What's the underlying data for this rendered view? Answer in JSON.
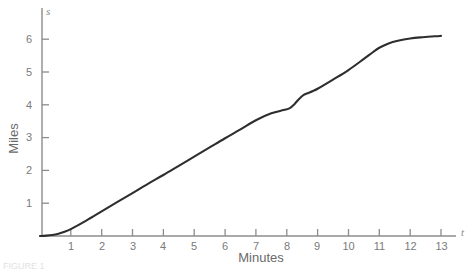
{
  "chart_data": {
    "type": "line",
    "title": "",
    "subtitle": "",
    "xlabel": "Minutes",
    "ylabel": "Miles",
    "x_axis_symbol": "t",
    "y_axis_symbol": "s",
    "xlim": [
      0,
      13.6
    ],
    "ylim": [
      0,
      6.45
    ],
    "xticks": [
      1,
      2,
      3,
      4,
      5,
      6,
      7,
      8,
      9,
      10,
      11,
      12,
      13
    ],
    "yticks": [
      1,
      2,
      3,
      4,
      5,
      6
    ],
    "xtick_labels": [
      "1",
      "2",
      "3",
      "4",
      "5",
      "6",
      "7",
      "8",
      "9",
      "10",
      "11",
      "12",
      "13"
    ],
    "ytick_labels": [
      "1",
      "2",
      "3",
      "4",
      "5",
      "6"
    ],
    "grid": false,
    "legend": false,
    "legend_position": "none",
    "line_color": "#2e2e2e",
    "axis_color": "#8c8c8c",
    "background_color": "#ffffff",
    "annotations": [],
    "series": [
      {
        "name": "distance",
        "x": [
          0.0,
          0.2,
          0.4,
          0.6,
          0.8,
          1.0,
          1.5,
          2.0,
          2.5,
          3.0,
          3.5,
          4.0,
          4.5,
          5.0,
          5.5,
          6.0,
          6.5,
          7.0,
          7.5,
          7.9,
          8.1,
          8.25,
          8.4,
          8.55,
          8.7,
          8.85,
          9.0,
          9.5,
          10.0,
          10.5,
          10.8,
          11.0,
          11.3,
          11.6,
          12.0,
          12.4,
          12.8,
          13.0
        ],
        "y": [
          0.0,
          0.01,
          0.03,
          0.07,
          0.13,
          0.21,
          0.47,
          0.75,
          1.03,
          1.31,
          1.59,
          1.86,
          2.14,
          2.42,
          2.7,
          2.98,
          3.25,
          3.53,
          3.74,
          3.84,
          3.9,
          4.02,
          4.18,
          4.3,
          4.36,
          4.42,
          4.49,
          4.77,
          5.06,
          5.4,
          5.61,
          5.74,
          5.87,
          5.95,
          6.02,
          6.06,
          6.09,
          6.1
        ]
      }
    ]
  },
  "labels": {
    "y_axis_title": "Miles",
    "x_axis_title": "Minutes",
    "y_symbol": "s",
    "x_symbol": "t",
    "caption": "FIGURE 1"
  }
}
